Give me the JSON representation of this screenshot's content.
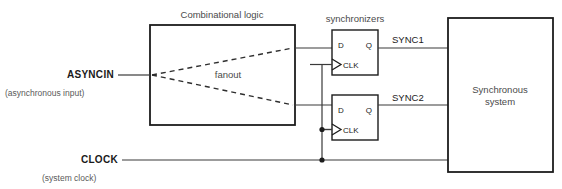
{
  "diagram": {
    "labels": {
      "combinational_logic": "Combinational logic",
      "fanout": "fanout",
      "synchronizers": "synchronizers",
      "asyncin": "ASYNCIN",
      "asyncin_note": "(asynchronous input)",
      "clock": "CLOCK",
      "clock_note": "(system clock)",
      "sync1": "SYNC1",
      "sync2": "SYNC2",
      "synchronous_system_line1": "Synchronous",
      "synchronous_system_line2": "system"
    },
    "flipflops": [
      {
        "name": "synchronizer-1",
        "d_label": "D",
        "q_label": "Q",
        "clk_label": "CLK",
        "output_label": "SYNC1"
      },
      {
        "name": "synchronizer-2",
        "d_label": "D",
        "q_label": "Q",
        "clk_label": "CLK",
        "output_label": "SYNC2"
      }
    ],
    "colors": {
      "background": "#ffffff",
      "box_stroke": "#1c1c1c",
      "wire": "#3a3a3a",
      "text_gray": "#4a4a4a",
      "text_dark": "#1a1a1a"
    }
  }
}
